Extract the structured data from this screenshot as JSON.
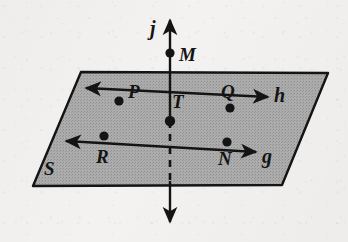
{
  "figure": {
    "width": 348,
    "height": 242,
    "background_color": "#f3f2f0",
    "ink_color": "#141414",
    "plane_fill_color": "#a9a9a9"
  },
  "plane": {
    "label": "S",
    "label_position": {
      "x": 44,
      "y": 159
    },
    "corners": [
      {
        "x": 81,
        "y": 72
      },
      {
        "x": 328,
        "y": 73
      },
      {
        "x": 282,
        "y": 185
      },
      {
        "x": 33,
        "y": 186
      }
    ]
  },
  "lines": [
    {
      "name": "h",
      "label": "h",
      "label_position": {
        "x": 274,
        "y": 85
      },
      "description": "line in plane S through P, T, Q",
      "start": {
        "x": 86,
        "y": 88
      },
      "end": {
        "x": 268,
        "y": 97
      },
      "arrow_start": true,
      "arrow_end": true,
      "style": "solid"
    },
    {
      "name": "g",
      "label": "g",
      "label_position": {
        "x": 262,
        "y": 146
      },
      "description": "line in plane S through R, T, N",
      "start": {
        "x": 66,
        "y": 141
      },
      "end": {
        "x": 256,
        "y": 152
      },
      "arrow_start": true,
      "arrow_end": true,
      "style": "solid"
    },
    {
      "name": "j",
      "label": "j",
      "label_position": {
        "x": 150,
        "y": 18
      },
      "description": "vertical line through M and T, dashed where hidden behind plane S",
      "start": {
        "x": 170,
        "y": 20
      },
      "end": {
        "x": 170,
        "y": 222
      },
      "arrow_start": true,
      "arrow_end": true,
      "style": "solid-with-hidden-dash",
      "dash_from": {
        "x": 170,
        "y": 122
      },
      "dash_to": {
        "x": 170,
        "y": 181
      }
    }
  ],
  "points": [
    {
      "name": "M",
      "label": "M",
      "x": 170,
      "y": 53,
      "label_position": {
        "x": 179,
        "y": 45
      },
      "on": "j"
    },
    {
      "name": "P",
      "label": "P",
      "x": 119,
      "y": 101,
      "label_position": {
        "x": 128,
        "y": 82
      },
      "on": "h"
    },
    {
      "name": "T",
      "label": "T",
      "x": 170,
      "y": 121,
      "label_position": {
        "x": 172,
        "y": 92
      },
      "on": "g,h,j"
    },
    {
      "name": "Q",
      "label": "Q",
      "x": 230,
      "y": 108,
      "label_position": {
        "x": 221,
        "y": 82
      },
      "on": "h"
    },
    {
      "name": "R",
      "label": "R",
      "x": 104,
      "y": 136,
      "label_position": {
        "x": 96,
        "y": 147
      },
      "on": "g"
    },
    {
      "name": "N",
      "label": "N",
      "x": 227,
      "y": 142,
      "label_position": {
        "x": 218,
        "y": 149
      },
      "on": "g"
    }
  ]
}
